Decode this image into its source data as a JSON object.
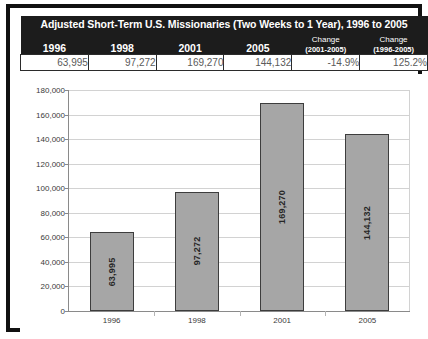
{
  "table": {
    "title": "Adjusted Short-Term U.S. Missionaries (Two Weeks to 1 Year), 1996 to 2005",
    "columns": [
      {
        "label": "1996",
        "sub": ""
      },
      {
        "label": "1998",
        "sub": ""
      },
      {
        "label": "2001",
        "sub": ""
      },
      {
        "label": "2005",
        "sub": ""
      },
      {
        "label": "(2001-2005)",
        "sub": "Change"
      },
      {
        "label": "(1996-2005)",
        "sub": "Change"
      }
    ],
    "values": [
      "63,995",
      "97,272",
      "169,270",
      "144,132",
      "-14.9%",
      "125.2%"
    ]
  },
  "chart_data": {
    "type": "bar",
    "title": "",
    "xlabel": "",
    "ylabel": "",
    "categories": [
      "1996",
      "1998",
      "2001",
      "2005"
    ],
    "values": [
      63995,
      97272,
      169270,
      144132
    ],
    "value_labels": [
      "63,995",
      "97,272",
      "169,270",
      "144,132"
    ],
    "ylim": [
      0,
      180000
    ],
    "yticks": [
      0,
      20000,
      40000,
      60000,
      80000,
      100000,
      120000,
      140000,
      160000,
      180000
    ],
    "ytick_labels": [
      "0",
      "20,000",
      "40,000",
      "60,000",
      "80,000",
      "100,000",
      "120,000",
      "140,000",
      "160,000",
      "180,000"
    ],
    "grid": true,
    "legend": false,
    "bar_color": "#a6a6a6",
    "bar_border_color": "#3d3d3d",
    "gridline_color": "#d2d2d2",
    "axis_color": "#8a8a8a"
  },
  "style": {
    "frame_color": "#111111",
    "header_bg": "#1c1c1c",
    "header_fg": "#ffffff",
    "value_fg": "#5a5a5a",
    "cell_border": "#2b2b2b"
  }
}
